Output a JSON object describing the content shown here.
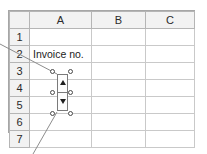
{
  "app": {
    "kind": "spreadsheet-screenshot",
    "background_color": "#ffffff"
  },
  "sheet": {
    "corner_label": "",
    "column_headers": [
      "A",
      "B",
      "C"
    ],
    "row_headers": [
      "1",
      "2",
      "3",
      "4",
      "5",
      "6",
      "7"
    ],
    "header_fill": "#f2f2f2",
    "gridline_color": "#c9c9c9",
    "border_color": "#a6a6a6",
    "rows": [
      {
        "row": "1",
        "cells": [
          "",
          "",
          ""
        ]
      },
      {
        "row": "2",
        "cells": [
          "Invoice no.",
          "",
          ""
        ]
      },
      {
        "row": "3",
        "cells": [
          "",
          "",
          ""
        ]
      },
      {
        "row": "4",
        "cells": [
          "",
          "",
          ""
        ]
      },
      {
        "row": "5",
        "cells": [
          "",
          "",
          ""
        ]
      },
      {
        "row": "6",
        "cells": [
          "",
          "",
          ""
        ]
      },
      {
        "row": "7",
        "cells": [
          "",
          "",
          ""
        ]
      }
    ]
  },
  "form_control": {
    "name": "spin-button",
    "label": "",
    "state": "selected",
    "anchor_cells": "A4:A6",
    "up_arrow_glyph": "▲",
    "down_arrow_glyph": "▼",
    "handle_count": 6,
    "handle_fill": "#ffffff",
    "handle_stroke": "#4a4a4a",
    "body_stroke": "#7a7a7a"
  },
  "callouts": [
    {
      "name": "upper-leader-line",
      "from_x": 0,
      "from_y": 44,
      "to_x": 57,
      "to_y": 74,
      "color": "#8c8c8c"
    },
    {
      "name": "lower-leader-line",
      "from_x": 33,
      "from_y": 154,
      "to_x": 57,
      "to_y": 112,
      "color": "#8c8c8c"
    }
  ]
}
